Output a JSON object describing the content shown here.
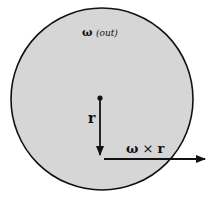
{
  "diagram": {
    "omega_label": "ω",
    "omega_direction": "(out)",
    "r_label": "r",
    "cross_omega": "ω",
    "cross_op": "×",
    "cross_r": "r",
    "colors": {
      "disk_fill": "#d6d6d6",
      "stroke": "#111111"
    }
  }
}
